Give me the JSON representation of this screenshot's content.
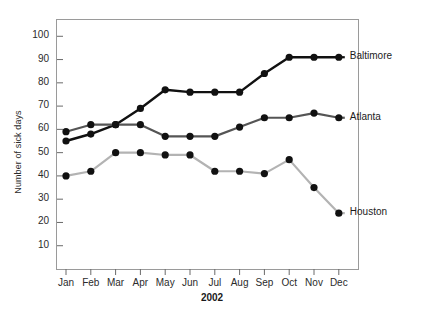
{
  "chart_data": {
    "type": "line",
    "title": "",
    "xlabel": "2002",
    "ylabel": "Number of sick days",
    "categories": [
      "Jan",
      "Feb",
      "Mar",
      "Apr",
      "May",
      "Jun",
      "Jul",
      "Aug",
      "Sep",
      "Oct",
      "Nov",
      "Dec"
    ],
    "yticks": [
      10,
      20,
      30,
      40,
      50,
      60,
      70,
      80,
      90,
      100
    ],
    "ylim": [
      0,
      107
    ],
    "grid": false,
    "legend_position": "right-inline",
    "series": [
      {
        "name": "Baltimore",
        "color": "#111111",
        "values": [
          55,
          58,
          62,
          69,
          77,
          76,
          76,
          76,
          84,
          91,
          91,
          91
        ]
      },
      {
        "name": "Atlanta",
        "color": "#555555",
        "values": [
          59,
          62,
          62,
          62,
          57,
          57,
          57,
          61,
          65,
          65,
          67,
          65
        ]
      },
      {
        "name": "Houston",
        "color": "#b3b3b3",
        "values": [
          40,
          42,
          50,
          50,
          49,
          49,
          42,
          42,
          41,
          47,
          35,
          24
        ]
      }
    ]
  },
  "axes": {
    "frame_color": "#9a9a9a",
    "tick_color": "#6a6a6a",
    "text_color": "#2b2b2b"
  }
}
